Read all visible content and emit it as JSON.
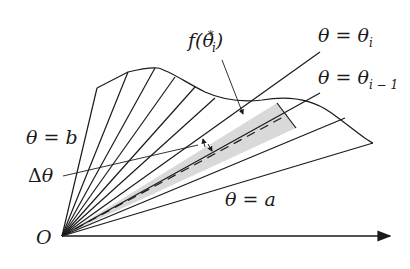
{
  "diagram": {
    "labels": {
      "f_theta_star": "f(θ",
      "f_sub": "i",
      "f_sup": "*",
      "f_close": ")",
      "theta_i": "θ = θ",
      "theta_i_sub": "i",
      "theta_i_minus_1": "θ = θ",
      "theta_i_minus_1_sub": "i − 1",
      "theta_b": "θ = b",
      "delta_theta_symbol": "Δ",
      "delta_theta_var": "θ",
      "theta_a": "θ = a",
      "origin": "O"
    },
    "colors": {
      "line": "#1a1a1a",
      "shaded_sector": "#d9d9d9",
      "background": "#ffffff"
    }
  }
}
